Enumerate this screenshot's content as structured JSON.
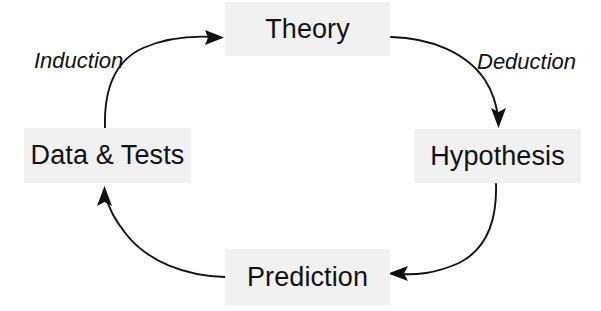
{
  "diagram": {
    "type": "cycle-diagram",
    "background_color": "#ffffff",
    "node_fill_color": "#f1f1f1",
    "stroke_color": "#111111",
    "text_color": "#111111",
    "nodes": [
      {
        "id": "theory",
        "label": "Theory",
        "position": "top"
      },
      {
        "id": "hypothesis",
        "label": "Hypothesis",
        "position": "right"
      },
      {
        "id": "prediction",
        "label": "Prediction",
        "position": "bottom"
      },
      {
        "id": "datatests",
        "label": "Data & Tests",
        "position": "left"
      }
    ],
    "edges": [
      {
        "id": "theory-to-hypothesis",
        "label": "Deduction",
        "from": "theory",
        "to": "hypothesis",
        "label_style": "italic"
      },
      {
        "id": "hypothesis-to-prediction",
        "label": "",
        "from": "hypothesis",
        "to": "prediction",
        "label_style": "italic"
      },
      {
        "id": "prediction-to-datatests",
        "label": "",
        "from": "prediction",
        "to": "datatests",
        "label_style": "italic"
      },
      {
        "id": "datatests-to-theory",
        "label": "Induction",
        "from": "datatests",
        "to": "theory",
        "label_style": "italic"
      }
    ]
  }
}
